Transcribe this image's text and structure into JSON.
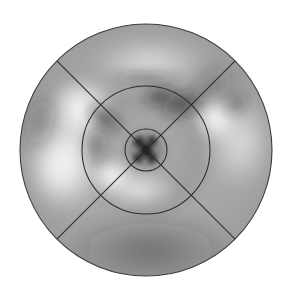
{
  "figure": {
    "title": "",
    "type": "polar-grayscale-field",
    "background_color": "#ffffff",
    "canvas": {
      "width": 290,
      "height": 300
    }
  },
  "chart_data": {
    "type": "heatmap",
    "projection": "polar",
    "title": "",
    "subtitle": "",
    "xlabel": "",
    "ylabel": "",
    "legend": [],
    "annotations": [],
    "grid": true,
    "colormap": {
      "name": "grayscale",
      "low_color": "#151515",
      "mid_color": "#9a9a9a",
      "high_color": "#f6f6f6",
      "value_low": 0.0,
      "value_high": 1.0
    },
    "geometry": {
      "center_x": 146,
      "center_y": 150,
      "outer_radius": 126,
      "middle_radius": 64,
      "inner_radius": 21,
      "radial_rings": [
        21,
        64,
        126
      ],
      "spoke_angles_deg": [
        45,
        135,
        225,
        315
      ],
      "spoke_count": 4,
      "sector_count": 4
    },
    "features": [
      {
        "name": "core-dark-cloverleaf",
        "r": 0,
        "theta_deg": 0,
        "value": 0.05,
        "radius_px": 14
      },
      {
        "name": "core-lobe-upper-left",
        "r": 8,
        "theta_deg": 135,
        "value": 0.08,
        "radius_px": 7
      },
      {
        "name": "core-lobe-upper-right",
        "r": 8,
        "theta_deg": 45,
        "value": 0.1,
        "radius_px": 6
      },
      {
        "name": "core-lobe-lower-left",
        "r": 8,
        "theta_deg": 215,
        "value": 0.12,
        "radius_px": 6
      },
      {
        "name": "core-lobe-lower-right",
        "r": 9,
        "theta_deg": 330,
        "value": 0.14,
        "radius_px": 6
      },
      {
        "name": "dark-arc-upper-right",
        "r": 52,
        "theta_deg": 52,
        "value": 0.3,
        "radius_px": 26
      },
      {
        "name": "dark-lobe-north",
        "r": 46,
        "theta_deg": 75,
        "value": 0.34,
        "radius_px": 22
      },
      {
        "name": "dark-lobe-outer-ne",
        "r": 88,
        "theta_deg": 38,
        "value": 0.4,
        "radius_px": 24
      },
      {
        "name": "dark-band-west-inner",
        "r": 44,
        "theta_deg": 168,
        "value": 0.4,
        "radius_px": 22
      },
      {
        "name": "dark-band-northwest",
        "r": 58,
        "theta_deg": 140,
        "value": 0.42,
        "radius_px": 20
      },
      {
        "name": "bright-ring-west",
        "r": 70,
        "theta_deg": 186,
        "value": 0.92,
        "radius_px": 30
      },
      {
        "name": "bright-lobe-northwest",
        "r": 74,
        "theta_deg": 152,
        "value": 0.88,
        "radius_px": 24
      },
      {
        "name": "bright-lobe-north",
        "r": 84,
        "theta_deg": 95,
        "value": 0.86,
        "radius_px": 28
      },
      {
        "name": "bright-crescent-south",
        "r": 36,
        "theta_deg": 255,
        "value": 0.84,
        "radius_px": 26
      },
      {
        "name": "bright-lobe-east",
        "r": 92,
        "theta_deg": 12,
        "value": 0.86,
        "radius_px": 26
      },
      {
        "name": "flat-field-south",
        "r": 100,
        "theta_deg": 270,
        "value": 0.62,
        "radius_px": 60
      }
    ],
    "radial_profile": {
      "r_values": [
        0,
        10,
        21,
        32,
        45,
        58,
        64,
        80,
        96,
        112,
        126
      ],
      "mean_values": [
        0.08,
        0.3,
        0.55,
        0.6,
        0.52,
        0.58,
        0.62,
        0.66,
        0.64,
        0.62,
        0.6
      ]
    }
  }
}
